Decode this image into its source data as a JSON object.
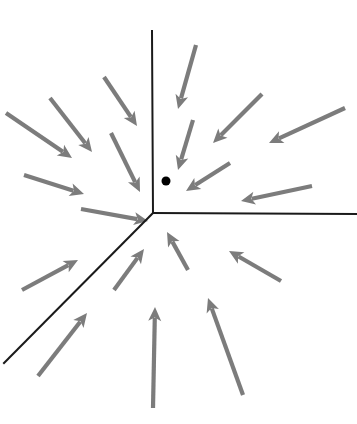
{
  "figure": {
    "type": "diagram",
    "width": 357,
    "height": 424,
    "background_color": "#ffffff"
  },
  "chart_data": {
    "type": "quiver",
    "title": "",
    "xlabel": "",
    "ylabel": "",
    "xlim": [
      0,
      357
    ],
    "ylim": [
      0,
      424
    ],
    "grid": false,
    "legend": null
  },
  "colors": {
    "arrow": "#7c7c7c",
    "separatrix": "#1a1a1a",
    "dot": "#000000",
    "background": "#ffffff"
  },
  "junction": {
    "label": "junction-point",
    "x": 153,
    "y": 213
  },
  "marker_dot": {
    "label": "equilibrium-dot",
    "cx": 166,
    "cy": 181,
    "r": 4.5
  },
  "separatrices": [
    {
      "name": "ray-up",
      "x1": 153,
      "y1": 213,
      "x2": 152,
      "y2": 31
    },
    {
      "name": "ray-right",
      "x1": 153,
      "y1": 213,
      "x2": 357,
      "y2": 214
    },
    {
      "name": "ray-down-left",
      "x1": 153,
      "y1": 213,
      "x2": 4,
      "y2": 363
    }
  ],
  "separatrix_width": 2.0,
  "arrow_width": 4.2,
  "arrow_head_length": 14,
  "arrow_head_halfwidth": 6.5,
  "arrows": [
    {
      "name": "arrow-ul-outer-1",
      "x1": 6,
      "y1": 113,
      "x2": 72,
      "y2": 158
    },
    {
      "name": "arrow-ul-outer-2",
      "x1": 50,
      "y1": 98,
      "x2": 92,
      "y2": 152
    },
    {
      "name": "arrow-ul-inner-1",
      "x1": 24,
      "y1": 175,
      "x2": 84,
      "y2": 194
    },
    {
      "name": "arrow-ul-inner-2",
      "x1": 111,
      "y1": 133,
      "x2": 140,
      "y2": 192
    },
    {
      "name": "arrow-ul-inner-3",
      "x1": 104,
      "y1": 77,
      "x2": 137,
      "y2": 126
    },
    {
      "name": "arrow-ul-near-1",
      "x1": 81,
      "y1": 209,
      "x2": 148,
      "y2": 221
    },
    {
      "name": "arrow-top-1",
      "x1": 196,
      "y1": 45,
      "x2": 178,
      "y2": 109
    },
    {
      "name": "arrow-top-2",
      "x1": 193,
      "y1": 120,
      "x2": 178,
      "y2": 170
    },
    {
      "name": "arrow-ur-1",
      "x1": 262,
      "y1": 94,
      "x2": 213,
      "y2": 143
    },
    {
      "name": "arrow-ur-2",
      "x1": 345,
      "y1": 108,
      "x2": 269,
      "y2": 143
    },
    {
      "name": "arrow-ur-3",
      "x1": 230,
      "y1": 163,
      "x2": 186,
      "y2": 191
    },
    {
      "name": "arrow-ur-4",
      "x1": 312,
      "y1": 186,
      "x2": 241,
      "y2": 201
    },
    {
      "name": "arrow-ll-1",
      "x1": 22,
      "y1": 290,
      "x2": 78,
      "y2": 260
    },
    {
      "name": "arrow-ll-2",
      "x1": 38,
      "y1": 376,
      "x2": 87,
      "y2": 313
    },
    {
      "name": "arrow-lc-1",
      "x1": 114,
      "y1": 290,
      "x2": 144,
      "y2": 249
    },
    {
      "name": "arrow-lc-2",
      "x1": 188,
      "y1": 270,
      "x2": 167,
      "y2": 232
    },
    {
      "name": "arrow-lc-3",
      "x1": 153,
      "y1": 408,
      "x2": 155,
      "y2": 307
    },
    {
      "name": "arrow-lr-1",
      "x1": 281,
      "y1": 281,
      "x2": 229,
      "y2": 251
    },
    {
      "name": "arrow-lr-2",
      "x1": 243,
      "y1": 395,
      "x2": 208,
      "y2": 298
    }
  ]
}
